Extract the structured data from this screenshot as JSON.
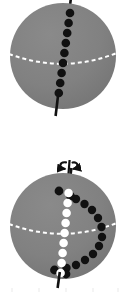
{
  "figure": {
    "background_color": "#ffffff",
    "width": 128,
    "height": 294,
    "sphere_fill": "#808080",
    "sphere_fill_shadow": "#767676",
    "equator_color": "#ffffff",
    "axis_color": "#111111",
    "dot_black": "#111111",
    "dot_white": "#ffffff",
    "panels": [
      {
        "name": "top-panel",
        "label": "Sphere without rotation arrow",
        "sphere": {
          "center_x": 63,
          "center_y": 56,
          "radius": 53,
          "cropped_top": true
        },
        "equator": {
          "style": "dashed",
          "color": "#ffffff",
          "dash_pattern": "4 3",
          "sag": 13
        },
        "axis": {
          "tilt_degrees": 8,
          "top_stub_visible": true,
          "bottom_stub_visible": true,
          "color": "#111111"
        },
        "dot_track": {
          "color": "#111111",
          "count": 9,
          "description": "evenly spaced black dots descending along the tilted polar meridian"
        }
      },
      {
        "name": "bottom-panel",
        "label": "Sphere with rotation arrow at north pole",
        "sphere": {
          "center_x": 63,
          "center_y": 226,
          "radius": 53,
          "cropped_top": false
        },
        "equator": {
          "style": "dashed",
          "color": "#ffffff",
          "dash_pattern": "4 3",
          "sag": 13
        },
        "axis": {
          "tilt_degrees": 8,
          "top_stub_visible": true,
          "bottom_stub_visible": true,
          "color": "#111111"
        },
        "rotation_arrow": {
          "name": "rotation-arrow-icon",
          "label": "spin direction about the polar axis",
          "color": "#111111",
          "direction": "counter-clockwise-viewed-from-above"
        },
        "dot_track_meridian": {
          "color": "#ffffff",
          "count": 9,
          "description": "white dots descending along the tilted polar meridian"
        },
        "dot_track_arc": {
          "color": "#111111",
          "count": 15,
          "description": "black dots sweeping out in an arc to the right of the meridian"
        },
        "dot_caps": {
          "color": "#111111",
          "count": 4,
          "description": "black dots capping the top and bottom of the white meridian track"
        }
      }
    ]
  },
  "chart_data": {
    "type": "scatter",
    "xlabel": "",
    "ylabel": "",
    "series": [
      {
        "name": "top-sphere-meridian-black-dots",
        "color": "#111111",
        "points": [
          [
            70.0,
            13.0
          ],
          [
            68.6,
            23.0
          ],
          [
            67.2,
            33.0
          ],
          [
            65.8,
            43.0
          ],
          [
            64.4,
            53.0
          ],
          [
            63.0,
            63.0
          ],
          [
            61.6,
            73.0
          ],
          [
            60.2,
            83.0
          ],
          [
            58.8,
            93.0
          ]
        ]
      },
      {
        "name": "bottom-sphere-meridian-white-dots",
        "color": "#ffffff",
        "points": [
          [
            68.6,
            193.0
          ],
          [
            67.6,
            203.0
          ],
          [
            66.6,
            213.0
          ],
          [
            65.6,
            223.0
          ],
          [
            64.6,
            233.0
          ],
          [
            63.6,
            243.0
          ],
          [
            62.6,
            253.0
          ],
          [
            61.6,
            263.0
          ],
          [
            60.6,
            273.0
          ]
        ]
      },
      {
        "name": "bottom-sphere-meridian-black-caps",
        "color": "#111111",
        "points": [
          [
            59.0,
            191.0
          ],
          [
            70.5,
            196.0
          ],
          [
            54.5,
            270.0
          ],
          [
            66.0,
            274.0
          ]
        ]
      },
      {
        "name": "bottom-sphere-arc-black-dots",
        "color": "#111111",
        "points": [
          [
            76.0,
            199.0
          ],
          [
            84.5,
            204.0
          ],
          [
            92.0,
            210.0
          ],
          [
            98.0,
            218.0
          ],
          [
            101.5,
            227.0
          ],
          [
            102.0,
            237.0
          ],
          [
            99.0,
            246.0
          ],
          [
            93.0,
            254.0
          ],
          [
            85.0,
            260.0
          ],
          [
            76.0,
            265.0
          ],
          [
            66.5,
            268.0
          ]
        ]
      }
    ],
    "annotations": [
      {
        "name": "rotation-arrow-icon",
        "text": "",
        "x": 66,
        "y": 166,
        "description": "curved arrow around the polar axis indicating rotation"
      }
    ],
    "grid": false,
    "legend": "none"
  }
}
